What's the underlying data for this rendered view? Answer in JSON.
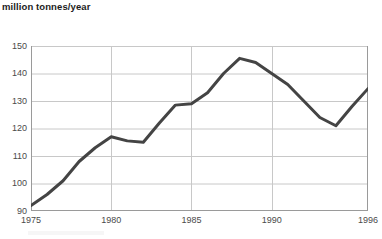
{
  "chart_data": {
    "type": "line",
    "title": "million tonnes/year",
    "xlabel": "",
    "ylabel": "million tonnes/year",
    "x": [
      1975,
      1976,
      1977,
      1978,
      1979,
      1980,
      1981,
      1982,
      1983,
      1984,
      1985,
      1986,
      1987,
      1988,
      1989,
      1990,
      1991,
      1992,
      1993,
      1994,
      1995,
      1996
    ],
    "values": [
      92,
      96,
      101,
      108,
      113,
      117,
      115.5,
      115,
      122,
      128.5,
      129,
      133,
      140,
      145.5,
      144,
      140,
      136,
      130,
      124,
      121,
      128,
      134.5
    ],
    "series": [
      {
        "name": "million tonnes/year",
        "values": [
          92,
          96,
          101,
          108,
          113,
          117,
          115.5,
          115,
          122,
          128.5,
          129,
          133,
          140,
          145.5,
          144,
          140,
          136,
          130,
          124,
          121,
          128,
          134.5
        ]
      }
    ],
    "xlim": [
      1975,
      1996
    ],
    "ylim": [
      90,
      150
    ],
    "ytick_labels": [
      "90",
      "100",
      "110",
      "120",
      "130",
      "140",
      "150"
    ],
    "yticks": [
      90,
      100,
      110,
      120,
      130,
      140,
      150
    ],
    "xtick_labels": [
      "1975",
      "1980",
      "1985",
      "1990",
      "1996"
    ],
    "xticks": [
      1975,
      1980,
      1985,
      1990,
      1996
    ],
    "grid": true,
    "legend": false,
    "legend_position": "none",
    "line_color": "#444444",
    "grid_color": "#c8c8c8",
    "axis_color": "#9a9a9a",
    "background_color": "#ffffff"
  }
}
